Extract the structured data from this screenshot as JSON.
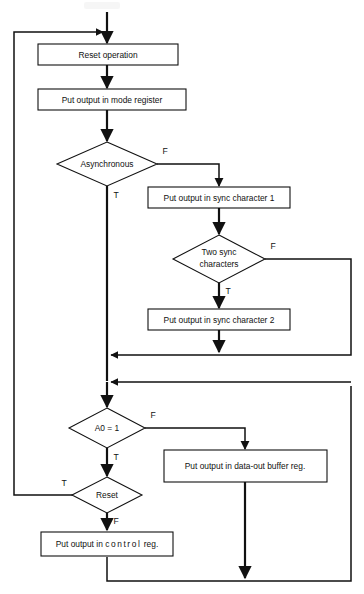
{
  "diagram": {
    "type": "flowchart",
    "colors": {
      "stroke": "#111111",
      "fill": "#ffffff",
      "background": "#ffffff"
    },
    "nodes": [
      {
        "id": "reset_operation",
        "kind": "process",
        "label": "Reset operation"
      },
      {
        "id": "mode_register",
        "kind": "process",
        "label": "Put output in mode register"
      },
      {
        "id": "asynchronous",
        "kind": "decision",
        "label": "Asynchronous"
      },
      {
        "id": "sync_character_1",
        "kind": "process",
        "label": "Put output in sync character 1"
      },
      {
        "id": "two_sync_characters",
        "kind": "decision",
        "label_line1": "Two sync",
        "label_line2": "characters"
      },
      {
        "id": "sync_character_2",
        "kind": "process",
        "label": "Put output in sync character 2"
      },
      {
        "id": "a0_equals_1",
        "kind": "decision",
        "label": "A0 = 1"
      },
      {
        "id": "data_out_buffer_reg",
        "kind": "process",
        "label": "Put output in data-out buffer reg."
      },
      {
        "id": "reset",
        "kind": "decision",
        "label": "Reset"
      },
      {
        "id": "control_reg",
        "kind": "process",
        "label_prefix": "Put output in ",
        "label_spaced": "control",
        "label_suffix": " reg."
      }
    ],
    "branch_labels": {
      "asynchronous_false": "F",
      "asynchronous_true": "T",
      "two_sync_false": "F",
      "two_sync_true": "T",
      "a0_false": "F",
      "a0_true": "T",
      "reset_true": "T",
      "reset_false": "F"
    }
  }
}
